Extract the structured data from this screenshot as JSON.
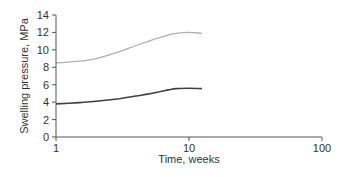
{
  "chart_data": {
    "type": "line",
    "title": "",
    "xlabel": "Time, weeks",
    "ylabel": "Swelling pressure, MPa",
    "xscale": "log",
    "xlim": [
      1,
      100
    ],
    "ylim": [
      0,
      14
    ],
    "x_ticks": [
      "1",
      "10",
      "100"
    ],
    "y_ticks": [
      "0",
      "2",
      "4",
      "6",
      "8",
      "10",
      "12",
      "14"
    ],
    "grid": false,
    "legend": null,
    "series": [
      {
        "name": "upper curve",
        "color": "#b0b0b0",
        "x": [
          1,
          1.5,
          2,
          3,
          4,
          5,
          6,
          7,
          8,
          10,
          12.5
        ],
        "y": [
          8.5,
          8.7,
          9.0,
          9.8,
          10.5,
          11.0,
          11.4,
          11.7,
          11.9,
          12.0,
          11.9
        ]
      },
      {
        "name": "lower curve",
        "color": "#404040",
        "x": [
          1,
          1.5,
          2,
          3,
          4,
          5,
          6,
          7,
          8,
          10,
          12.5
        ],
        "y": [
          3.8,
          3.95,
          4.1,
          4.4,
          4.7,
          4.95,
          5.2,
          5.4,
          5.55,
          5.6,
          5.55
        ]
      }
    ]
  }
}
